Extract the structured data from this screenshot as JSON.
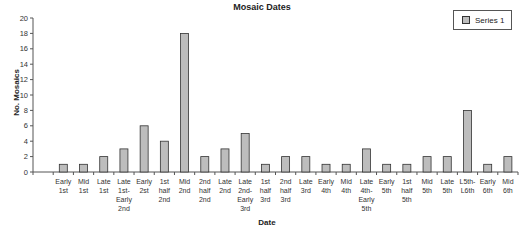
{
  "chart_data": {
    "type": "bar",
    "title": "Mosaic Dates",
    "xlabel": "Date",
    "ylabel": "No. Mosaics",
    "ylim": [
      0,
      20
    ],
    "yticks": [
      0,
      2,
      4,
      6,
      8,
      10,
      12,
      14,
      16,
      18,
      20
    ],
    "grid": false,
    "legend_position": "top-right",
    "categories": [
      "",
      "Early 1st",
      "Mid 1st",
      "Late 1st",
      "Late 1st-Early 2nd",
      "Early 2st",
      "1st half 2nd",
      "Mid 2nd",
      "2nd half 2nd",
      "Late 2nd",
      "Late 2nd-Early 3rd",
      "1st half 3rd",
      "2nd half 3rd",
      "Late 3rd",
      "Early 4th",
      "Mid 4th",
      "Late 4th-Early 5th",
      "Early 5th",
      "1st half 5th",
      "Mid 5th",
      "Late 5th",
      "L5th-L6th",
      "Early 6th",
      "Mid 6th"
    ],
    "category_lines": [
      [
        ""
      ],
      [
        "Early",
        "1st"
      ],
      [
        "Mid",
        "1st"
      ],
      [
        "Late",
        "1st"
      ],
      [
        "Late",
        "1st-",
        "Early",
        "2nd"
      ],
      [
        "Early",
        "2st"
      ],
      [
        "1st",
        "half",
        "2nd"
      ],
      [
        "Mid",
        "2nd"
      ],
      [
        "2nd",
        "half",
        "2nd"
      ],
      [
        "Late",
        "2nd"
      ],
      [
        "Late",
        "2nd-",
        "Early",
        "3rd"
      ],
      [
        "1st",
        "half",
        "3rd"
      ],
      [
        "2nd",
        "half",
        "3rd"
      ],
      [
        "Late",
        "3rd"
      ],
      [
        "Early",
        "4th"
      ],
      [
        "Mid",
        "4th"
      ],
      [
        "Late",
        "4th-",
        "Early",
        "5th"
      ],
      [
        "Early",
        "5th"
      ],
      [
        "1st",
        "half",
        "5th"
      ],
      [
        "Mid",
        "5th"
      ],
      [
        "Late",
        "5th"
      ],
      [
        "L5th-",
        "L6th"
      ],
      [
        "Early",
        "6th"
      ],
      [
        "Mid",
        "6th"
      ]
    ],
    "series": [
      {
        "name": "Series 1",
        "color": "#bdbdbd",
        "values": [
          0,
          1,
          1,
          2,
          3,
          6,
          4,
          18,
          2,
          3,
          5,
          1,
          2,
          2,
          1,
          1,
          3,
          1,
          1,
          2,
          2,
          8,
          1,
          2
        ]
      }
    ]
  },
  "legend": {
    "label": "Series 1"
  }
}
